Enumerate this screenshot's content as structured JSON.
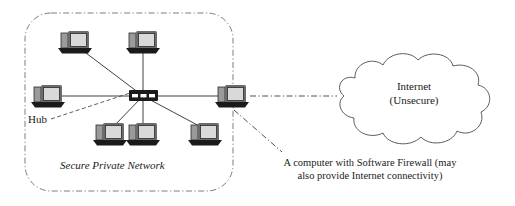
{
  "diagram": {
    "title_text_visible": false,
    "secure_zone": {
      "label": "Secure Private Network",
      "border_style": "dash-dot",
      "border_color": "#6e6e6e"
    },
    "hub": {
      "label": "Hub",
      "icon": "network-hub-icon",
      "color": "#1a1a1a",
      "x": 143,
      "y": 96
    },
    "workstations": [
      {
        "name": "workstation-top-left",
        "icon": "desktop-computer-icon",
        "x": 75,
        "y": 42
      },
      {
        "name": "workstation-top-right",
        "icon": "desktop-computer-icon",
        "x": 143,
        "y": 42
      },
      {
        "name": "workstation-mid-left",
        "icon": "desktop-computer-icon",
        "x": 48,
        "y": 96
      },
      {
        "name": "workstation-bottom-left",
        "icon": "desktop-computer-icon",
        "x": 110,
        "y": 134
      },
      {
        "name": "workstation-bottom-mid",
        "icon": "desktop-computer-icon",
        "x": 143,
        "y": 134
      },
      {
        "name": "workstation-bottom-right",
        "icon": "desktop-computer-icon",
        "x": 205,
        "y": 134
      }
    ],
    "firewall_computer": {
      "icon": "desktop-computer-icon",
      "caption": "A computer with Software Firewall (may also provide Internet connectivity)",
      "caption_line1": "A computer with Software Firewall (may",
      "caption_line2": "also provide Internet connectivity)",
      "x": 232,
      "y": 96
    },
    "internet_cloud": {
      "icon": "cloud-icon",
      "label_line1": "Internet",
      "label_line2": "(Unsecure)",
      "outline_color": "#4a4a4a",
      "fill_color": "#ffffff"
    },
    "links": {
      "lan_style": "solid",
      "wan_style": "dash-dot",
      "leader_style": "dashed"
    }
  }
}
